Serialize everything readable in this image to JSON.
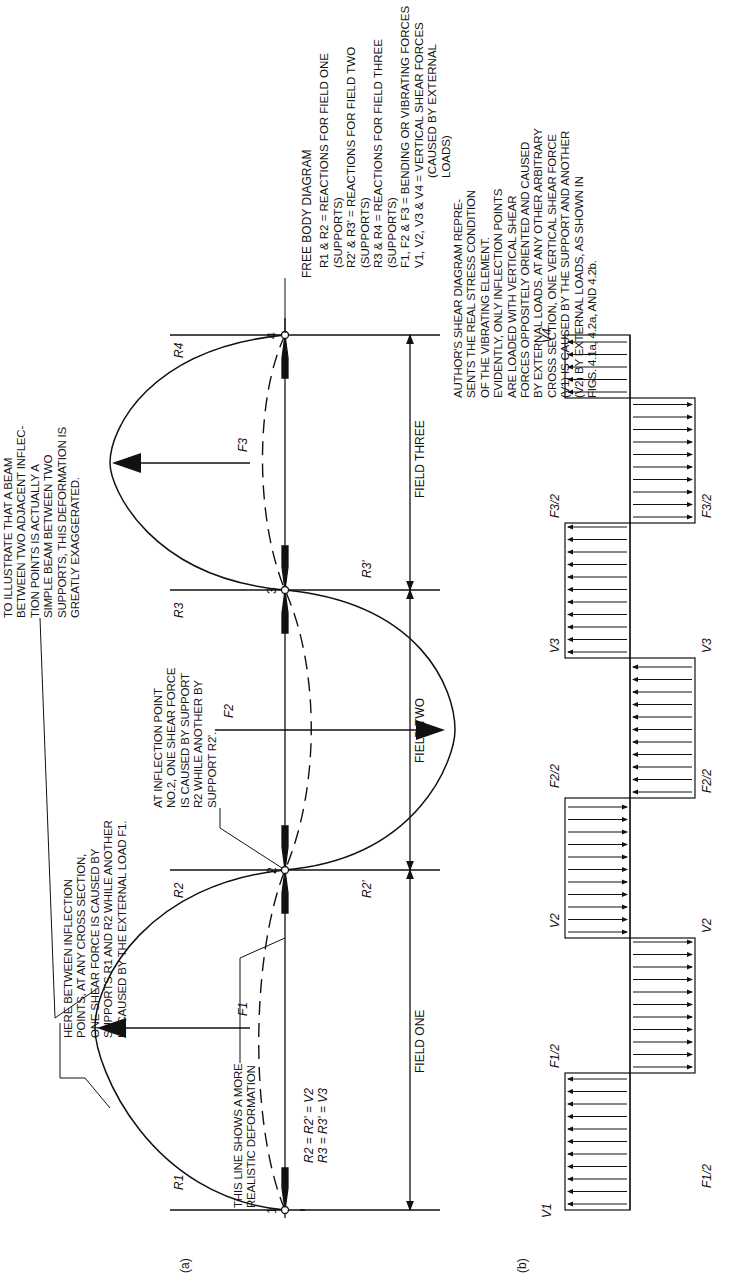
{
  "figure": {
    "panel_a_label": "(a)",
    "panel_b_label": "(b)",
    "fields": [
      "FIELD ONE",
      "FIELD TWO",
      "FIELD THREE"
    ],
    "inflection_points": [
      "1",
      "2",
      "3",
      "4"
    ],
    "reactions": {
      "r1": "R1",
      "r2": "R2",
      "r2p": "R2'",
      "r3": "R3",
      "r3p": "R3'",
      "r4": "R4"
    },
    "forces": {
      "f1": "F1",
      "f2": "F2",
      "f3": "F3"
    },
    "shear_labels": {
      "v1": "V1",
      "v2_left": "V2",
      "v2_right": "V2",
      "v3_left": "V3",
      "v3_right": "V3",
      "v4": "V4",
      "f1_half_top": "F1/2",
      "f1_half_bottom": "F1/2",
      "f2_half_top": "F2/2",
      "f2_half_bottom": "F2/2",
      "f3_half_top": "F3/2",
      "f3_half_bottom": "F3/2"
    },
    "equations": {
      "line1": "R2 = R2' = V2",
      "line2": "R3 = R3' = V3"
    }
  },
  "annotations": {
    "between_inflection": "HERE BETWEEN INFLECTION\nPOINTS, AT ANY CROSS SECTION,\nONE SHEAR FORCE IS CAUSED BY\nSUPPORTS R1 AND R2 WHILE ANOTHER\nIS CAUSED BY THE EXTERNAL LOAD F1.",
    "simple_beam": "TO ILLUSTRATE THAT A BEAM\nBETWEEN TWO ADJACENT INFLEC-\nTION POINTS IS ACTUALLY A\nSIMPLE BEAM BETWEEN TWO\nSUPPORTS, THIS DEFORMATION IS\nGREATLY EXAGGERATED.",
    "inflection_point_2": "AT INFLECTION POINT\nNO.2, ONE SHEAR FORCE\nIS CAUSED BY SUPPORT\nR2 WHILE ANOTHER BY\nSUPPORT R2'.",
    "realistic_deformation": "THIS LINE SHOWS A MORE\nREALISTIC DEFORMATION",
    "authors_shear": "AUTHOR'S SHEAR DIAGRAM REPRE-\nSENTS THE REAL STRESS CONDITION\nOF THE VIBRATING ELEMENT.\nEVIDENTLY, ONLY INFLECTION POINTS\nARE LOADED WITH VERTICAL SHEAR\nFORCES OPPOSITELY ORIENTED AND CAUSED\nBY EXTERNAL LOADS. AT ANY OTHER ARBITRARY\nCROSS SECTION, ONE VERTICAL SHEAR FORCE\n(V1) IS CAUSED BY THE SUPPORT AND ANOTHER\n(V2) BY EXTERNAL LOADS, AS SHOWN IN\nFIGS. 4.1a, 4.2a, AND 4.2b."
  },
  "legend": {
    "title": "FREE BODY DIAGRAM",
    "items": [
      "R1 & R2 = REACTIONS FOR FIELD ONE (SUPPORTS)",
      "R2' & R3' = REACTIONS FOR FIELD TWO (SUPPORTS)",
      "R3 & R4 = REACTIONS FOR FIELD THREE (SUPPORTS)",
      "F1, F2 & F3 = BENDING OR VIBRATING FORCES",
      "V1, V2, V3 & V4 = VERTICAL SHEAR FORCES",
      "(CAUSED BY EXTERNAL LOADS)"
    ]
  },
  "colors": {
    "ink": "#111111",
    "paper": "#ffffff"
  }
}
